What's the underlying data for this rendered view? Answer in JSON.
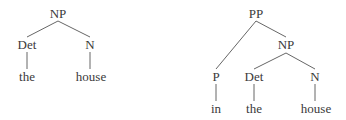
{
  "trees": [
    {
      "name": "noun-phrase-tree",
      "nodes": [
        {
          "id": "np",
          "label": "NP",
          "x": 58,
          "y": 14
        },
        {
          "id": "det",
          "label": "Det",
          "x": 27,
          "y": 45
        },
        {
          "id": "n",
          "label": "N",
          "x": 90,
          "y": 45
        },
        {
          "id": "the",
          "label": "the",
          "x": 27,
          "y": 77
        },
        {
          "id": "house",
          "label": "house",
          "x": 91,
          "y": 77
        }
      ],
      "edges": [
        [
          58,
          21,
          27,
          37
        ],
        [
          58,
          21,
          90,
          37
        ],
        [
          27,
          52,
          27,
          69
        ],
        [
          90,
          52,
          90,
          69
        ]
      ]
    },
    {
      "name": "prepositional-phrase-tree",
      "nodes": [
        {
          "id": "pp",
          "label": "PP",
          "x": 256,
          "y": 14
        },
        {
          "id": "np",
          "label": "NP",
          "x": 286,
          "y": 45
        },
        {
          "id": "p",
          "label": "P",
          "x": 216,
          "y": 77
        },
        {
          "id": "det",
          "label": "Det",
          "x": 254,
          "y": 77
        },
        {
          "id": "n",
          "label": "N",
          "x": 315,
          "y": 77
        },
        {
          "id": "in",
          "label": "in",
          "x": 216,
          "y": 109
        },
        {
          "id": "the",
          "label": "the",
          "x": 254,
          "y": 109
        },
        {
          "id": "house",
          "label": "house",
          "x": 316,
          "y": 109
        }
      ],
      "edges": [
        [
          256,
          21,
          216,
          69
        ],
        [
          256,
          21,
          286,
          37
        ],
        [
          286,
          53,
          254,
          69
        ],
        [
          286,
          53,
          315,
          69
        ],
        [
          216,
          84,
          216,
          101
        ],
        [
          254,
          84,
          254,
          101
        ],
        [
          315,
          84,
          315,
          101
        ]
      ]
    }
  ],
  "line_color": "#555555"
}
